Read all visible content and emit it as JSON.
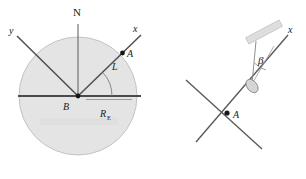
{
  "figure": {
    "background_color": "#ffffff",
    "earth_fill": "#e3e3e3",
    "earth_stroke": "#b9b9b9",
    "line_color": "#4a4a4a",
    "thin_line_color": "#8c8c8c",
    "bar_fill": "#dcdcdc",
    "text_color": "#1a1a1a"
  },
  "left_panel": {
    "name": "earth-geometry-diagram",
    "labels": {
      "north": "N",
      "axis_x": "x",
      "axis_y": "y",
      "point_a": "A",
      "center_b": "B",
      "angle_l": "L",
      "radius_symbol": "R",
      "radius_subscript": "E"
    },
    "geometry": {
      "center": [
        78,
        96
      ],
      "radius": 59,
      "point_a": [
        122,
        57
      ],
      "axis_x_end": [
        140,
        37
      ],
      "axis_y_end": [
        18,
        37
      ],
      "north_end": [
        78,
        24
      ],
      "equator_left": [
        18,
        96
      ],
      "equator_right": [
        141,
        96
      ],
      "radius_line_end": [
        131,
        99
      ]
    }
  },
  "right_panel": {
    "name": "local-horizon-detail-diagram",
    "labels": {
      "axis_x": "x",
      "point_a": "A",
      "angle_beta": "β"
    },
    "geometry": {
      "point_a": [
        228,
        113
      ],
      "axis_x_end": [
        287,
        36
      ],
      "horizon_start": [
        186,
        81
      ],
      "horizon_end": [
        259,
        147
      ],
      "vertex": [
        251,
        83
      ],
      "bar_center": [
        264,
        32
      ],
      "bar_angle_deg": -28
    }
  }
}
